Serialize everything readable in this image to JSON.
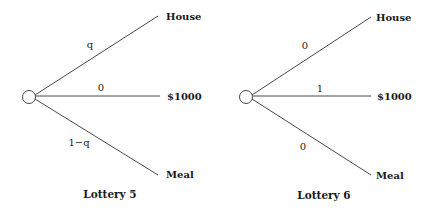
{
  "lotteries": [
    {
      "title": "Lottery 5",
      "branches": [
        {
          "prob": "q",
          "outcome": "House"
        },
        {
          "prob": "0",
          "outcome": "$1000"
        },
        {
          "prob": "1−q",
          "outcome": "Meal"
        }
      ]
    },
    {
      "title": "Lottery 6",
      "branches": [
        {
          "prob": "0",
          "outcome": "House"
        },
        {
          "prob": "1",
          "outcome": "$1000"
        },
        {
          "prob": "0",
          "outcome": "Meal"
        }
      ]
    }
  ],
  "colors": {
    "line": "#333333",
    "text": "#1a1a1a",
    "background": "#ffffff"
  }
}
